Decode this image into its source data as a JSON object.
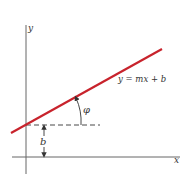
{
  "diagram": {
    "axes": {
      "x_label": "x",
      "y_label": "y"
    },
    "line": {
      "equation": "y = mx + b",
      "color": "#c8232c"
    },
    "angle_label": "φ",
    "intercept_label": "b",
    "colors": {
      "axis": "#555555",
      "dash": "#333333",
      "text": "#333333",
      "background": "#ffffff"
    }
  }
}
